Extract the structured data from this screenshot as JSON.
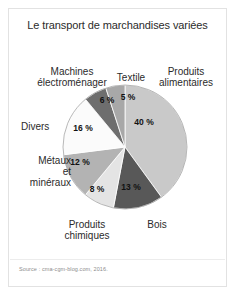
{
  "figure": {
    "title": "Le transport de marchandises variées",
    "source": "Source : cma-cgm-blog.com, 2016."
  },
  "chart_data": {
    "type": "pie",
    "title": "Le transport de marchandises variées",
    "unit": "%",
    "legend": "labels-around-slices",
    "total": 100,
    "categories": [
      "Produits alimentaires",
      "Bois",
      "Produits chimiques",
      "Métaux et minéraux",
      "Divers",
      "Machines électroménager",
      "Textile"
    ],
    "values": [
      40,
      13,
      8,
      12,
      16,
      6,
      5
    ],
    "value_labels": [
      "40 %",
      "13 %",
      "8 %",
      "12 %",
      "16 %",
      "6 %",
      "5 %"
    ],
    "colors": [
      "#c9c9c9",
      "#585858",
      "#e4e4e4",
      "#b3b3b3",
      "#fbfbfb",
      "#6e6e6e",
      "#a8a8a8"
    ],
    "slices": [
      {
        "label": "Produits alimentaires",
        "value": 40,
        "value_label": "40 %",
        "color": "#c9c9c9"
      },
      {
        "label": "Bois",
        "value": 13,
        "value_label": "13 %",
        "color": "#585858"
      },
      {
        "label": "Produits chimiques",
        "value": 8,
        "value_label": "8 %",
        "color": "#e4e4e4"
      },
      {
        "label": "Métaux et minéraux",
        "value": 12,
        "value_label": "12 %",
        "color": "#b3b3b3"
      },
      {
        "label": "Divers",
        "value": 16,
        "value_label": "16 %",
        "color": "#fbfbfb"
      },
      {
        "label": "Machines électroménager",
        "value": 6,
        "value_label": "6 %",
        "color": "#6e6e6e"
      },
      {
        "label": "Textile",
        "value": 5,
        "value_label": "5 %",
        "color": "#a8a8a8"
      }
    ]
  },
  "labels": {
    "machines_line1": "Machines",
    "machines_line2": "électroménager",
    "textile": "Textile",
    "alimentaires_line1": "Produits",
    "alimentaires_line2": "alimentaires",
    "divers": "Divers",
    "metaux_line1": "Métaux",
    "metaux_line2": "et",
    "metaux_line3": "minéraux",
    "chimiques_line1": "Produits",
    "chimiques_line2": "chimiques",
    "bois": "Bois"
  }
}
